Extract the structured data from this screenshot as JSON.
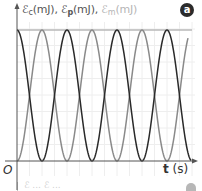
{
  "badge": "a",
  "ylabel": {
    "ec": "ℰ",
    "ec_sub": "c",
    "ec_unit": "(mJ), ",
    "ep": "ℰ",
    "ep_sub": "p",
    "ep_unit": "(mJ), ",
    "em": "ℰ",
    "em_sub": "m",
    "em_unit": "(mJ)"
  },
  "origin_label": "O",
  "xlabel": {
    "var": "t",
    "unit": " (s)"
  },
  "colors": {
    "ec": "#2a2a2a",
    "ep": "#8a8a8a",
    "em": "#b8b8b8",
    "axis": "#555555",
    "grid": "#eeeeee"
  },
  "chart_data": {
    "type": "line",
    "title": "",
    "xlabel": "t (s)",
    "ylabel": "ℰc(mJ), ℰp(mJ), ℰm(mJ)",
    "grid": true,
    "legend": "none (labels in y-axis title)",
    "series": [
      {
        "name": "ℰc",
        "shape": "cos^2",
        "normalized_max": 1,
        "phase_start": "max",
        "periods_shown": 3.5
      },
      {
        "name": "ℰp",
        "shape": "sin^2",
        "normalized_max": 1,
        "phase_start": "zero",
        "periods_shown": 3.4
      },
      {
        "name": "ℰm",
        "shape": "constant",
        "normalized_value": 1
      }
    ],
    "x_units": "arbitrary (no tick values shown)",
    "y_units": "arbitrary (no tick values shown)"
  },
  "geometry": {
    "x0": 17,
    "y0": 161,
    "ytop": 30,
    "period_px": 50,
    "x_end_dark": 191,
    "x_end_gray": 188,
    "em_end": 192
  },
  "next_panel": {
    "label": "ℰ ... ℰ ..."
  }
}
